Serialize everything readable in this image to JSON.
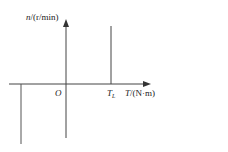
{
  "diagram": {
    "y_axis_label_var": "n",
    "y_axis_label_unit": "/(r/min)",
    "x_axis_label_var": "T",
    "x_axis_label_unit": "/(N·m)",
    "origin_label": "O",
    "load_torque_label": "T",
    "load_torque_subscript": "L",
    "line_color": "#444444"
  }
}
